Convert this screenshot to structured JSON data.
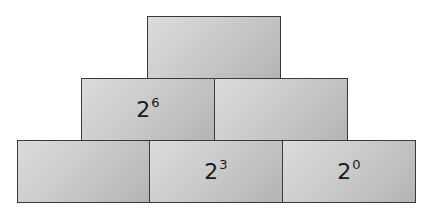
{
  "diagram": {
    "type": "number-pyramid",
    "rows": [
      {
        "row": "top",
        "blocks": [
          {
            "base": "",
            "exponent": ""
          }
        ]
      },
      {
        "row": "middle",
        "blocks": [
          {
            "base": "2",
            "exponent": "6"
          },
          {
            "base": "",
            "exponent": ""
          }
        ]
      },
      {
        "row": "bottom",
        "blocks": [
          {
            "base": "",
            "exponent": ""
          },
          {
            "base": "2",
            "exponent": "3"
          },
          {
            "base": "2",
            "exponent": "0"
          }
        ]
      }
    ],
    "colors": {
      "block_fill": "#c9c9c9",
      "border": "#3a3a3a",
      "text": "#1a1a1a"
    }
  }
}
